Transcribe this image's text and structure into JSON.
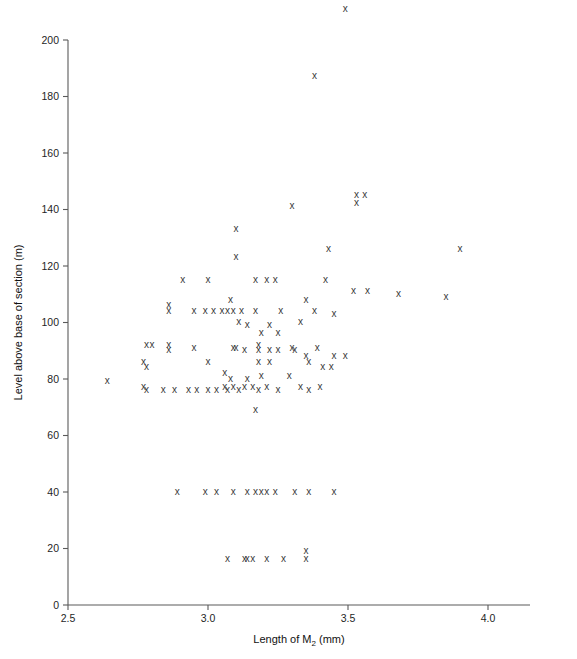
{
  "figure": {
    "background_color": "#ffffff",
    "marker_glyph": "x",
    "marker_color": "#3a3a3a",
    "axis_color": "#5a5a5a"
  },
  "axes": {
    "x_title_prefix": "Length of M",
    "x_title_subscript": "2",
    "x_title_suffix": " (mm)",
    "y_title": "Level above base of section (m)",
    "x_ticks": [
      "2.5",
      "3.0",
      "3.5",
      "4.0"
    ],
    "y_ticks": [
      "0",
      "20",
      "40",
      "60",
      "80",
      "100",
      "120",
      "140",
      "160",
      "180",
      "200"
    ]
  },
  "chart_data": {
    "type": "scatter",
    "title": "",
    "xlabel": "Length of M2 (mm)",
    "ylabel": "Level above base of section (m)",
    "xlim": [
      2.5,
      4.15
    ],
    "ylim": [
      0,
      212
    ],
    "xticks": [
      2.5,
      3.0,
      3.5,
      4.0
    ],
    "yticks": [
      0,
      20,
      40,
      60,
      80,
      100,
      120,
      140,
      160,
      180,
      200
    ],
    "grid": false,
    "legend": "none",
    "marker": "x",
    "series": [
      {
        "name": "Specimens",
        "points": [
          [
            3.49,
            211
          ],
          [
            3.38,
            187
          ],
          [
            3.56,
            145
          ],
          [
            3.53,
            142
          ],
          [
            3.53,
            145
          ],
          [
            3.3,
            141
          ],
          [
            3.1,
            133
          ],
          [
            3.1,
            123
          ],
          [
            3.43,
            126
          ],
          [
            3.9,
            126
          ],
          [
            2.91,
            115
          ],
          [
            3.0,
            115
          ],
          [
            3.17,
            115
          ],
          [
            3.21,
            115
          ],
          [
            3.24,
            115
          ],
          [
            3.42,
            115
          ],
          [
            3.08,
            108
          ],
          [
            3.35,
            108
          ],
          [
            2.86,
            106
          ],
          [
            2.86,
            104
          ],
          [
            2.95,
            104
          ],
          [
            2.99,
            104
          ],
          [
            3.02,
            104
          ],
          [
            3.05,
            104
          ],
          [
            3.07,
            104
          ],
          [
            3.09,
            104
          ],
          [
            3.12,
            104
          ],
          [
            3.17,
            104
          ],
          [
            3.26,
            104
          ],
          [
            3.38,
            104
          ],
          [
            3.52,
            111
          ],
          [
            3.57,
            111
          ],
          [
            3.68,
            110
          ],
          [
            3.85,
            109
          ],
          [
            3.45,
            103
          ],
          [
            3.11,
            100
          ],
          [
            3.14,
            99
          ],
          [
            3.22,
            99
          ],
          [
            3.33,
            100
          ],
          [
            3.19,
            96
          ],
          [
            3.25,
            96
          ],
          [
            2.78,
            92
          ],
          [
            2.8,
            92
          ],
          [
            2.86,
            92
          ],
          [
            2.86,
            90
          ],
          [
            2.95,
            91
          ],
          [
            3.09,
            91
          ],
          [
            3.1,
            91
          ],
          [
            3.13,
            90
          ],
          [
            3.18,
            92
          ],
          [
            3.18,
            90
          ],
          [
            3.22,
            90
          ],
          [
            3.25,
            90
          ],
          [
            3.3,
            91
          ],
          [
            3.31,
            90
          ],
          [
            3.35,
            88
          ],
          [
            3.39,
            91
          ],
          [
            2.77,
            86
          ],
          [
            3.0,
            86
          ],
          [
            3.18,
            86
          ],
          [
            3.22,
            86
          ],
          [
            3.36,
            86
          ],
          [
            3.45,
            88
          ],
          [
            3.49,
            88
          ],
          [
            2.78,
            84
          ],
          [
            3.06,
            82
          ],
          [
            3.08,
            80
          ],
          [
            3.14,
            80
          ],
          [
            3.19,
            81
          ],
          [
            3.29,
            81
          ],
          [
            3.41,
            84
          ],
          [
            3.44,
            84
          ],
          [
            2.64,
            79
          ],
          [
            2.77,
            77
          ],
          [
            2.78,
            76
          ],
          [
            2.84,
            76
          ],
          [
            2.88,
            76
          ],
          [
            2.93,
            76
          ],
          [
            2.96,
            76
          ],
          [
            3.0,
            76
          ],
          [
            3.03,
            76
          ],
          [
            3.06,
            77
          ],
          [
            3.07,
            76
          ],
          [
            3.09,
            77
          ],
          [
            3.11,
            76
          ],
          [
            3.13,
            77
          ],
          [
            3.16,
            77
          ],
          [
            3.18,
            76
          ],
          [
            3.21,
            77
          ],
          [
            3.25,
            76
          ],
          [
            3.33,
            77
          ],
          [
            3.36,
            76
          ],
          [
            3.4,
            77
          ],
          [
            3.17,
            69
          ],
          [
            2.89,
            40
          ],
          [
            2.99,
            40
          ],
          [
            3.03,
            40
          ],
          [
            3.09,
            40
          ],
          [
            3.14,
            40
          ],
          [
            3.17,
            40
          ],
          [
            3.19,
            40
          ],
          [
            3.21,
            40
          ],
          [
            3.24,
            40
          ],
          [
            3.31,
            40
          ],
          [
            3.36,
            40
          ],
          [
            3.45,
            40
          ],
          [
            3.07,
            16
          ],
          [
            3.13,
            16
          ],
          [
            3.14,
            16
          ],
          [
            3.16,
            16
          ],
          [
            3.21,
            16
          ],
          [
            3.27,
            16
          ],
          [
            3.35,
            19
          ],
          [
            3.35,
            16
          ]
        ]
      }
    ]
  }
}
